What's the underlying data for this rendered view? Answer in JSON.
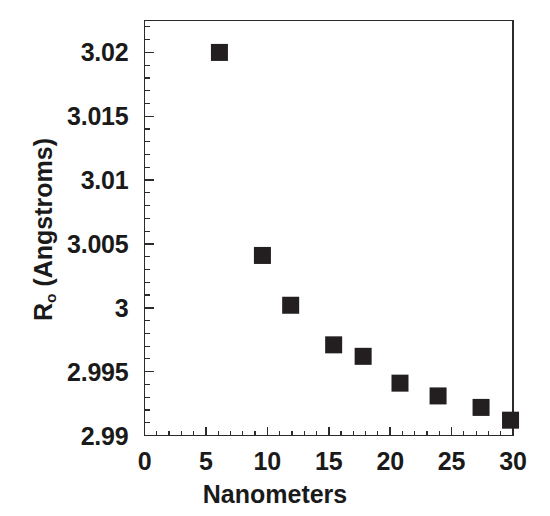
{
  "chart_data": {
    "type": "scatter",
    "title": "",
    "xlabel": "Nanometers",
    "ylabel": "R_o (Angstroms)",
    "ylabel_base": "R",
    "ylabel_sub": "o",
    "ylabel_tail": " (Angstroms)",
    "xlim": [
      0,
      30
    ],
    "ylim": [
      2.99,
      3.0225
    ],
    "grid": false,
    "legend": null,
    "marker": "filled-square",
    "marker_color": "#231f20",
    "x_major_ticks": [
      0,
      5,
      10,
      15,
      20,
      25,
      30
    ],
    "x_tick_labels": [
      "0",
      "5",
      "10",
      "15",
      "20",
      "25",
      "30"
    ],
    "x_minor_interval": 1,
    "y_major_ticks": [
      2.99,
      2.995,
      3.0,
      3.005,
      3.01,
      3.015,
      3.02
    ],
    "y_tick_labels": [
      "2.99",
      "2.995",
      "3",
      "3.005",
      "3.01",
      "3.015",
      "3.02"
    ],
    "y_minor_interval": 0.001,
    "x": [
      6.1,
      9.6,
      11.9,
      15.4,
      17.8,
      20.8,
      23.9,
      27.4,
      29.8
    ],
    "y": [
      3.02,
      3.0041,
      3.0002,
      2.9971,
      2.9962,
      2.9941,
      2.9931,
      2.9922,
      2.9912
    ],
    "points": [
      {
        "x": 6.1,
        "y": 3.02
      },
      {
        "x": 9.6,
        "y": 3.0041
      },
      {
        "x": 11.9,
        "y": 3.0002
      },
      {
        "x": 15.4,
        "y": 2.9971
      },
      {
        "x": 17.8,
        "y": 2.9962
      },
      {
        "x": 20.8,
        "y": 2.9941
      },
      {
        "x": 23.9,
        "y": 2.9931
      },
      {
        "x": 27.4,
        "y": 2.9922
      },
      {
        "x": 29.8,
        "y": 2.9912
      }
    ]
  },
  "axes": {
    "x_title": "Nanometers",
    "y_title_base": "R",
    "y_title_sub": "o",
    "y_title_tail": " (Angstroms)"
  },
  "colors": {
    "marker": "#231f20",
    "axis": "#2b2b2b",
    "background": "#ffffff",
    "text": "#1a1a1a"
  }
}
